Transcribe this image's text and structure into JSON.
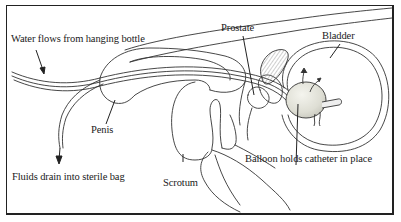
{
  "diagram": {
    "type": "anatomical illustration",
    "labels": {
      "water": "Water flows from hanging bottle",
      "fluids": "Fluids drain into sterile bag",
      "penis": "Penis",
      "scrotum": "Scrotum",
      "prostate": "Prostate",
      "bladder": "Bladder",
      "balloon": "Balloon holds catheter in place"
    },
    "colors": {
      "line": "#333333",
      "frame": "#222222",
      "balloon_fill": "#e8e8e0",
      "hatch": "#888888",
      "background": "#ffffff"
    }
  }
}
